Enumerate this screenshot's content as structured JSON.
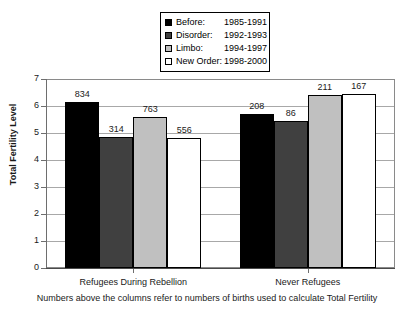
{
  "chart_data": {
    "type": "bar",
    "title": "",
    "xlabel": "",
    "ylabel": "Total Fertility Level",
    "ylim": [
      0,
      7
    ],
    "yticks": [
      "0",
      "1",
      "2",
      "3",
      "4",
      "5",
      "6",
      "7"
    ],
    "grid": true,
    "legend_position": "top-center",
    "categories": [
      "Refugees During Rebellion",
      "Never Refugees"
    ],
    "series": [
      {
        "name": "Before:",
        "years": "1985-1991",
        "color": "#000000",
        "values": [
          6.15,
          5.7
        ],
        "point_labels": [
          "834",
          "208"
        ]
      },
      {
        "name": "Disorder:",
        "years": "1992-1993",
        "color": "#404040",
        "values": [
          4.85,
          5.45
        ],
        "point_labels": [
          "314",
          "86"
        ]
      },
      {
        "name": "Limbo:",
        "years": "1994-1997",
        "color": "#c0c0c0",
        "values": [
          5.6,
          6.4
        ],
        "point_labels": [
          "763",
          "211"
        ]
      },
      {
        "name": "New Order:",
        "years": "1998-2000",
        "color": "#ffffff",
        "values": [
          4.8,
          6.45
        ],
        "point_labels": [
          "556",
          "167"
        ]
      }
    ],
    "annotations": [
      "Numbers above the columns refer to numbers of births used to calculate Total Fertility"
    ]
  },
  "caption": "Numbers above the columns refer to numbers of births used to calculate Total Fertility",
  "axis": {
    "y_title": "Total Fertility Level"
  }
}
